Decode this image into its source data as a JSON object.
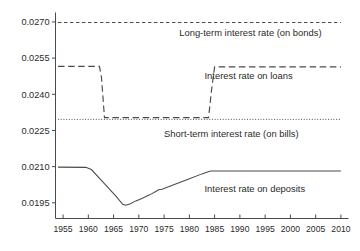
{
  "chart_data": {
    "type": "line",
    "title": "",
    "xlabel": "",
    "ylabel": "",
    "xlim": [
      1953.5,
      2011.5
    ],
    "ylim": [
      0.01885,
      0.02735
    ],
    "grid": false,
    "legend_position": "inline-annotations",
    "xticks": [
      1955,
      1960,
      1965,
      1970,
      1975,
      1980,
      1985,
      1990,
      1995,
      2000,
      2005,
      2010
    ],
    "xtick_labels": [
      "1955",
      "1960",
      "1965",
      "1970",
      "1975",
      "1980",
      "1985",
      "1990",
      "1995",
      "2000",
      "2005",
      "2010"
    ],
    "yticks": [
      0.0195,
      0.021,
      0.0225,
      0.024,
      0.0255,
      0.027
    ],
    "ytick_labels": [
      "0.0195",
      "0.0210",
      "0.0225",
      "0.0240",
      "0.0255",
      "0.0270"
    ],
    "series": [
      {
        "name": "Long-term interest rate (on bonds)",
        "style": "dashed",
        "label_x": 1978,
        "label_y": 0.02655,
        "x": [
          1954,
          2010
        ],
        "values": [
          0.02698,
          0.02698
        ]
      },
      {
        "name": "Interest rate on loans",
        "style": "long-dashed",
        "label_x": 1983,
        "label_y": 0.02478,
        "x": [
          1954,
          1962.2,
          1962.6,
          1963.2,
          1983.8,
          1984.4,
          1985.0,
          2010
        ],
        "values": [
          0.02516,
          0.02516,
          0.0247,
          0.02303,
          0.02303,
          0.0242,
          0.02514,
          0.02514
        ]
      },
      {
        "name": "Short-term interest rate (on bills)",
        "style": "dotted",
        "label_x": 1975,
        "label_y": 0.02235,
        "x": [
          1954,
          2010
        ],
        "values": [
          0.02296,
          0.02296
        ]
      },
      {
        "name": "Interest rate on deposits",
        "style": "solid",
        "label_x": 1983,
        "label_y": 0.0201,
        "x": [
          1954,
          1959.5,
          1960.6,
          1963.0,
          1965.5,
          1966.8,
          1967.4,
          1968.2,
          1969.4,
          1970.6,
          1971.6,
          1972.6,
          1973.5,
          1973.9,
          1974.6,
          1976.5,
          1979.5,
          1982.5,
          1983.6,
          1984.2,
          2010
        ],
        "values": [
          0.02098,
          0.02097,
          0.02088,
          0.02034,
          0.01977,
          0.01944,
          0.0194,
          0.01945,
          0.01958,
          0.01968,
          0.01978,
          0.01988,
          0.01999,
          0.02004,
          0.02006,
          0.02022,
          0.02046,
          0.0207,
          0.02078,
          0.02082,
          0.02082
        ]
      }
    ]
  }
}
